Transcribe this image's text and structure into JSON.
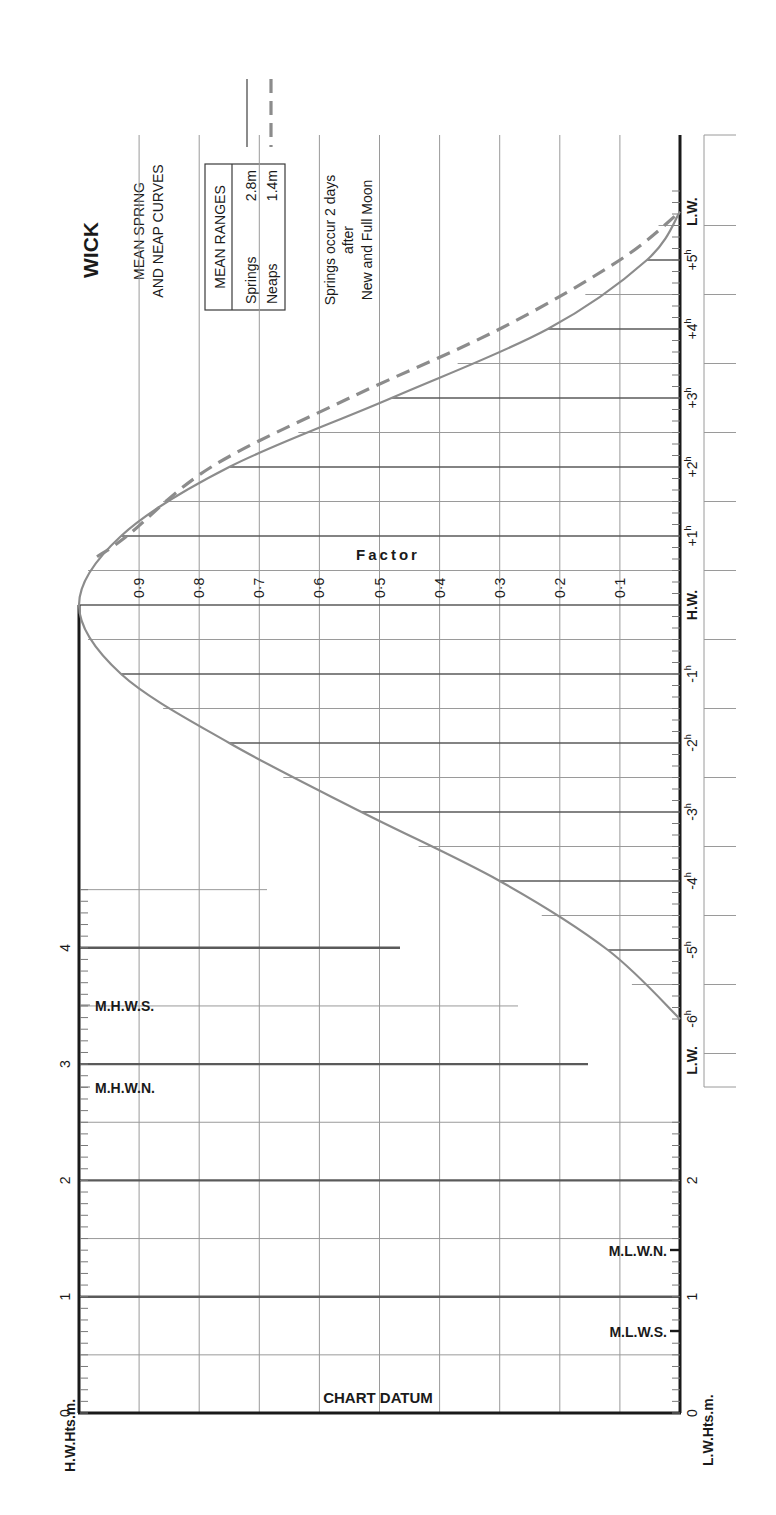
{
  "title": "WICK",
  "subtitle_line1": "MEAN SPRING",
  "subtitle_line2": "AND NEAP CURVES",
  "mean_ranges": {
    "header": "MEAN RANGES",
    "springs_label": "Springs",
    "springs_value": "2.8m",
    "neaps_label": "Neaps",
    "neaps_value": "1.4m"
  },
  "note_line1": "Springs occur 2 days",
  "note_line2": "after",
  "note_line3": "New and Full Moon",
  "factor_label": "Factor",
  "factor_ticks": [
    "0·9",
    "0·8",
    "0·7",
    "0·6",
    "0·5",
    "0·4",
    "0·3",
    "0·2",
    "0·1"
  ],
  "time_labels": {
    "lw_start": "L.W.",
    "m6": "-6h",
    "m5": "-5h",
    "m4": "-4h",
    "m3": "-3h",
    "m2": "-2h",
    "m1": "-1h",
    "hw": "H.W.",
    "p1": "+1h",
    "p2": "+2h",
    "p3": "+3h",
    "p4": "+4h",
    "p5": "+5h",
    "lw_end": "L.W."
  },
  "hw_axis": {
    "title": "H.W.Hts.m.",
    "ticks": [
      "0",
      "1",
      "2",
      "3",
      "4"
    ],
    "mhws": "M.H.W.S.",
    "mhwn": "M.H.W.N."
  },
  "lw_axis": {
    "title": "L.W.Hts.m.",
    "ticks": [
      "0",
      "1",
      "2"
    ],
    "mlwn": "M.L.W.N.",
    "mlws": "M.L.W.S."
  },
  "chart_datum": "CHART DATUM",
  "colors": {
    "curve": "#8c8c8c",
    "axis": "#1a1a1a",
    "grid": "#9a9a9a"
  },
  "chart_data": {
    "type": "line",
    "xlabel": "Time relative to High Water (hours)",
    "ylabel": "Factor",
    "x": [
      -6,
      -5,
      -4,
      -3,
      -2,
      -1,
      0,
      1,
      2,
      3,
      4,
      5,
      5.7
    ],
    "series": [
      {
        "name": "Springs (solid)",
        "values": [
          0.0,
          0.12,
          0.3,
          0.53,
          0.75,
          0.93,
          1.0,
          0.93,
          0.75,
          0.48,
          0.22,
          0.055,
          0.0
        ]
      },
      {
        "name": "Neaps (dashed)",
        "values": [
          null,
          null,
          null,
          null,
          null,
          null,
          null,
          0.92,
          0.78,
          0.55,
          0.3,
          0.1,
          0.0
        ]
      }
    ],
    "ylim": [
      0,
      1
    ],
    "xlim": [
      -6,
      5.7
    ],
    "grid": true,
    "height_scale_m": {
      "hw_range": [
        0,
        4.5
      ],
      "lw_range": [
        0,
        2
      ],
      "MHWS": 3.5,
      "MHWN": 2.8,
      "MLWN": 1.4,
      "MLWS": 0.7
    },
    "mean_ranges_m": {
      "springs": 2.8,
      "neaps": 1.4
    },
    "legend": [
      "Springs: solid line",
      "Neaps: dashed line"
    ],
    "legend_position": "top-left"
  }
}
